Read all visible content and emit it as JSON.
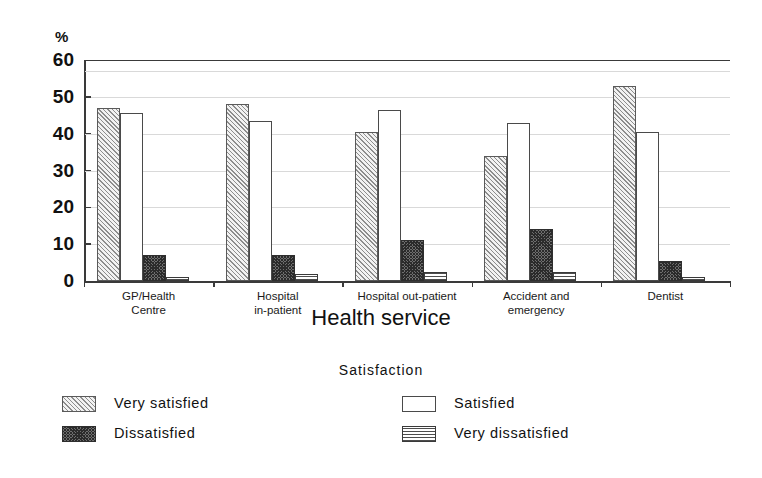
{
  "chart_data": {
    "type": "bar",
    "title": "",
    "xlabel": "Health service",
    "ylabel": "%",
    "ylim": [
      0,
      60
    ],
    "yticks": [
      0,
      10,
      20,
      30,
      40,
      50,
      60
    ],
    "grid": true,
    "legend_title": "Satisfaction",
    "legend_position": "bottom",
    "categories": [
      "GP/Health Centre",
      "Hospital in-patient",
      "Hospital out-patient",
      "Accident and emergency",
      "Dentist"
    ],
    "series": [
      {
        "name": "Very satisfied",
        "pattern": "diagonal-hatch-light",
        "values": [
          47,
          48,
          40.5,
          34,
          53
        ]
      },
      {
        "name": "Satisfied",
        "pattern": "empty-white",
        "values": [
          45.5,
          43.5,
          46.5,
          43,
          40.5
        ]
      },
      {
        "name": "Dissatisfied",
        "pattern": "dark-cross-hatch",
        "values": [
          7,
          7,
          11,
          14,
          5.5
        ]
      },
      {
        "name": "Very dissatisfied",
        "pattern": "horizontal-lines",
        "values": [
          1,
          2,
          2.5,
          2.5,
          1
        ]
      }
    ]
  },
  "axes": {
    "y_unit_label": "%",
    "y_tick_labels": [
      "60",
      "50",
      "40",
      "30",
      "20",
      "10",
      "0"
    ],
    "x_axis_title": "Health service",
    "category_labels": [
      [
        "GP/Health",
        "Centre"
      ],
      [
        "Hospital",
        "in-patient"
      ],
      [
        "Hospital out-patient"
      ],
      [
        "Accident and",
        "emergency"
      ],
      [
        "Dentist"
      ]
    ]
  },
  "legend": {
    "title": "Satisfaction",
    "items": [
      {
        "label": "Very satisfied"
      },
      {
        "label": "Satisfied"
      },
      {
        "label": "Dissatisfied"
      },
      {
        "label": "Very dissatisfied"
      }
    ]
  },
  "colors": {
    "axis": "#3a3a3a",
    "grid": "#d9d9d9",
    "text": "#111111",
    "background": "#ffffff"
  }
}
